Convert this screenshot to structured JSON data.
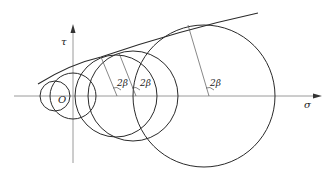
{
  "diagram": {
    "type": "Mohr circles with failure envelope",
    "axes": {
      "x_label": "σ",
      "y_label": "τ",
      "origin_label": "O"
    },
    "angle_labels": [
      "2β",
      "2β",
      "2β"
    ],
    "circles": [
      {
        "cx": 55,
        "r": 15
      },
      {
        "cx": 73,
        "r": 23
      },
      {
        "cx": 116,
        "r": 41
      },
      {
        "cx": 133,
        "r": 45
      },
      {
        "cx": 204,
        "r": 71
      }
    ],
    "colors": {
      "line": "#2a2a2a",
      "axis": "#9a9a9a",
      "background": "#ffffff"
    }
  }
}
